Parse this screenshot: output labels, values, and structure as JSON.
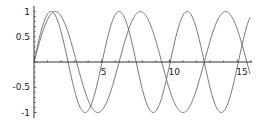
{
  "chart_data": {
    "type": "line",
    "title": "",
    "xlabel": "",
    "ylabel": "",
    "xlim": [
      0,
      16
    ],
    "ylim": [
      -1,
      1
    ],
    "grid": false,
    "legend": null,
    "x_ticks": [
      "5",
      "10",
      "15"
    ],
    "y_ticks": [
      "1",
      "0.5",
      "-0.5",
      "-1"
    ],
    "series": [
      {
        "name": "sin(x)",
        "function": "sin(x)",
        "x_range": [
          0,
          16
        ],
        "color": "#777777",
        "sample_points": [
          [
            0,
            0
          ],
          [
            1.57,
            1
          ],
          [
            3.14,
            0
          ],
          [
            4.71,
            -1
          ],
          [
            6.28,
            0
          ],
          [
            7.85,
            1
          ],
          [
            9.42,
            0
          ],
          [
            11.0,
            -1
          ],
          [
            12.57,
            0
          ],
          [
            14.14,
            1
          ],
          [
            15.71,
            0
          ]
        ]
      },
      {
        "name": "sin(1.25x)",
        "function": "sin(1.25x)",
        "x_range": [
          0,
          16
        ],
        "color": "#777777",
        "sample_points": [
          [
            0,
            0
          ],
          [
            1.26,
            1
          ],
          [
            2.51,
            0
          ],
          [
            3.77,
            -1
          ],
          [
            5.03,
            0
          ],
          [
            6.28,
            1
          ],
          [
            7.54,
            0
          ],
          [
            8.8,
            -1
          ],
          [
            10.05,
            0
          ],
          [
            11.31,
            1
          ],
          [
            12.57,
            0
          ],
          [
            13.82,
            -1
          ],
          [
            15.08,
            0
          ]
        ]
      }
    ]
  }
}
